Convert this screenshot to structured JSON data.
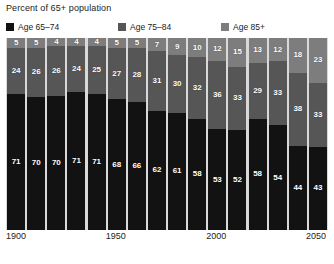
{
  "chart_data": {
    "type": "bar",
    "title": "Percent of 65+ population",
    "xlabel": "",
    "ylabel": "Percent of 65+ population",
    "ylim": [
      0,
      100
    ],
    "grid": false,
    "stacked": true,
    "stack_mode": "percent",
    "legend_position": "top",
    "categories": [
      "1900",
      "1910",
      "1920",
      "1930",
      "1940",
      "1950",
      "1960",
      "1970",
      "1980",
      "1990",
      "2000",
      "2010",
      "2020",
      "2030",
      "2040",
      "2050"
    ],
    "xtick_labels": [
      "1900",
      "1950",
      "2000",
      "2050"
    ],
    "xtick_categories": [
      "1900",
      "1950",
      "2000",
      "2050"
    ],
    "series": [
      {
        "name": "Age 65-74",
        "color": "#121212",
        "values": [
          71,
          70,
          70,
          71,
          71,
          68,
          66,
          62,
          61,
          58,
          53,
          52,
          58,
          54,
          44,
          43
        ]
      },
      {
        "name": "Age 75-84",
        "color": "#565656",
        "values": [
          24,
          26,
          26,
          24,
          25,
          27,
          28,
          31,
          30,
          32,
          36,
          33,
          29,
          33,
          38,
          33
        ]
      },
      {
        "name": "Age 85+",
        "color": "#7d7d7d",
        "values": [
          5,
          5,
          4,
          4,
          4,
          5,
          5,
          7,
          9,
          10,
          12,
          15,
          13,
          12,
          18,
          23
        ]
      }
    ]
  },
  "legend": {
    "items": [
      {
        "label": "Age 65–74",
        "color": "#121212"
      },
      {
        "label": "Age 75–84",
        "color": "#565656"
      },
      {
        "label": "Age 85+",
        "color": "#7d7d7d"
      }
    ]
  },
  "colors": {
    "plot_background": "#d9d9d9",
    "page_background": "#ffffff",
    "label_text": "#ffffff",
    "axis_text": "#222222"
  }
}
